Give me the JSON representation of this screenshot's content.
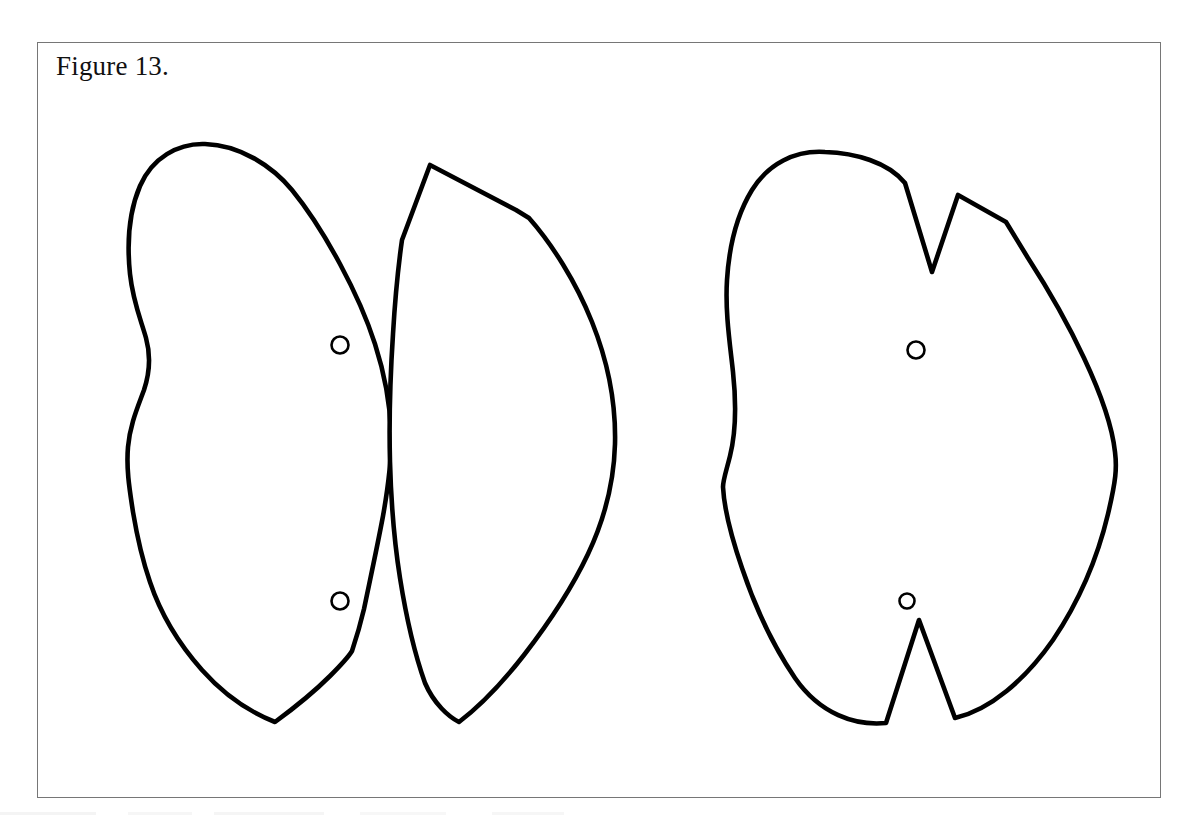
{
  "document": {
    "type": "patent-figure-drawing",
    "background_color": "#ffffff",
    "width": 1194,
    "height": 827
  },
  "figure": {
    "caption": "Figure 13.",
    "frame": {
      "x": 37,
      "y": 42,
      "width": 1124,
      "height": 756,
      "stroke_color": "#767676",
      "stroke_width": 1.4
    },
    "line_color": "#000000",
    "fill_color": "#ffffff",
    "stroke_width": 4.5
  },
  "shapes": [
    {
      "id": "left-panel-outline",
      "name": "left-panel-outline",
      "description": "elongated lobed panel with waisted left edge and pointed bottom tip",
      "stroke_width": 4.6,
      "path": "M 205 144 C 178 143 152 158 140 186 C 128 214 127 245 130 274 C 133 302 141 320 146 338 C 151 356 150 372 144 390 C 137 409 130 425 128 447 C 126 470 130 492 133 512 C 137 536 141 556 150 582 C 160 612 178 643 202 670 C 226 697 252 713 275 722 C 290 711 312 694 330 676 C 344 662 349 656 352 651 C 356 639 360 626 364 609 C 370 580 377 548 383 516 C 389 482 392 455 391 432 C 390 402 384 372 375 344 C 366 316 354 290 340 264 C 326 238 310 212 292 190 C 272 166 240 145 205 144 Z"
    },
    {
      "id": "middle-panel-outline",
      "name": "middle-panel-outline",
      "description": "leaf-shaped panel with apex at top-left, shoulder break, and pointed bottom tip",
      "stroke_width": 4.6,
      "path": "M 430 165 L 402 240 C 398 268 395 300 393 334 C 390 380 389 424 390 462 C 391 500 394 540 400 578 C 406 616 414 652 425 683 C 434 704 449 717 459 722 C 480 706 503 682 524 655 C 548 624 571 590 588 554 C 605 518 614 480 615 444 C 616 404 608 362 592 322 C 576 282 552 244 529 218 L 516 210 L 430 165 Z"
    },
    {
      "id": "right-panel-outline",
      "name": "right-panel-outline",
      "description": "broad panel with a deep V notch at the top-right and a narrow V notch at the bottom-center",
      "stroke_width": 4.6,
      "path": "M 825 152 C 795 150 768 164 752 190 C 736 216 729 248 727 280 C 725 312 730 344 733 372 C 736 400 736 432 730 456 C 726 472 723 480 723 487 C 724 506 731 536 742 568 C 754 604 772 644 795 678 C 820 714 855 726 886 723 L 919 620 L 955 718 C 990 710 1025 680 1053 640 C 1080 600 1098 556 1108 514 C 1116 480 1117 468 1115 452 C 1112 424 1100 392 1084 358 C 1070 328 1050 292 1028 258 L 1006 222 L 958 195 L 932 272 L 905 183 C 888 162 855 153 825 152 Z"
    }
  ],
  "markers": [
    {
      "id": "left-panel-hole-upper",
      "name": "hole-marker-circle",
      "panel": "left-panel-outline",
      "cx": 340,
      "cy": 345,
      "r": 8.5,
      "stroke_width": 2.6
    },
    {
      "id": "left-panel-hole-lower",
      "name": "hole-marker-circle",
      "panel": "left-panel-outline",
      "cx": 340,
      "cy": 601,
      "r": 8.5,
      "stroke_width": 2.6
    },
    {
      "id": "right-panel-hole-upper",
      "name": "hole-marker-circle",
      "panel": "right-panel-outline",
      "cx": 916,
      "cy": 350,
      "r": 8.5,
      "stroke_width": 2.6
    },
    {
      "id": "right-panel-hole-lower",
      "name": "hole-marker-circle",
      "panel": "right-panel-outline",
      "cx": 907,
      "cy": 601,
      "r": 7.5,
      "stroke_width": 2.6
    }
  ],
  "scan_artifacts": [
    {
      "x": 0,
      "y": 812,
      "width": 96,
      "opacity": 0.5
    },
    {
      "x": 128,
      "y": 812,
      "width": 64,
      "opacity": 0.4
    },
    {
      "x": 214,
      "y": 812,
      "width": 110,
      "opacity": 0.45
    },
    {
      "x": 360,
      "y": 812,
      "width": 86,
      "opacity": 0.35
    },
    {
      "x": 492,
      "y": 812,
      "width": 72,
      "opacity": 0.4
    }
  ]
}
